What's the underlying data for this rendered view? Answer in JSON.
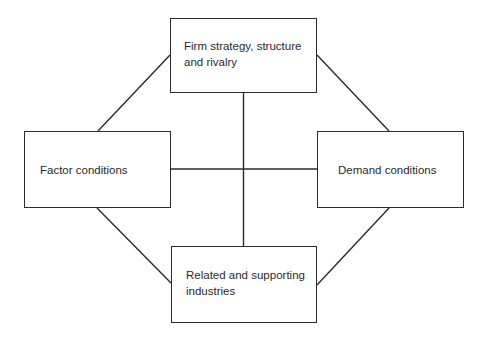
{
  "diagram": {
    "type": "porter-diamond",
    "nodes": {
      "top": {
        "label": "Firm strategy, structure and rivalry"
      },
      "left": {
        "label": "Factor conditions"
      },
      "right": {
        "label": "Demand conditions"
      },
      "bottom": {
        "label": "Related and supporting industries"
      }
    },
    "edges": [
      {
        "from": "top",
        "to": "left"
      },
      {
        "from": "top",
        "to": "right"
      },
      {
        "from": "bottom",
        "to": "left"
      },
      {
        "from": "bottom",
        "to": "right"
      },
      {
        "from": "top",
        "to": "bottom"
      },
      {
        "from": "left",
        "to": "right"
      }
    ],
    "colors": {
      "line": "#2b2b2b",
      "text": "#2a2a2a",
      "background": "#ffffff"
    }
  }
}
